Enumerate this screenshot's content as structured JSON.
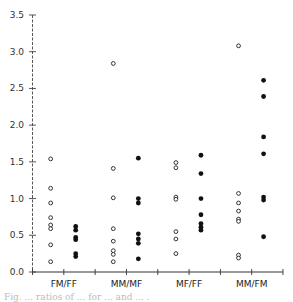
{
  "chart_data": {
    "type": "scatter",
    "title": "",
    "xlabel": "",
    "ylabel": "",
    "ylim": [
      0,
      3.5
    ],
    "yticks": [
      0.0,
      0.5,
      1.0,
      1.5,
      2.0,
      2.5,
      3.0,
      3.5
    ],
    "ytick_labels": [
      "0.0",
      "0.5",
      "1.0",
      "1.5",
      "2.0",
      "2.5",
      "3.0",
      "3.5"
    ],
    "categories": [
      "FM/FF",
      "MM/MF",
      "MF/FF",
      "MM/FM"
    ],
    "grid": false,
    "legend": null,
    "series": [
      {
        "name": "open",
        "marker": "open-circle",
        "values": [
          [
            1.54,
            1.14,
            0.94,
            0.74,
            0.64,
            0.59,
            0.37,
            0.14
          ],
          [
            2.84,
            1.41,
            1.01,
            0.59,
            0.42,
            0.29,
            0.24,
            0.14
          ],
          [
            1.49,
            1.42,
            1.02,
            0.99,
            0.55,
            0.45,
            0.25
          ],
          [
            3.08,
            1.07,
            0.94,
            0.83,
            0.72,
            0.69,
            0.23,
            0.19
          ]
        ]
      },
      {
        "name": "filled",
        "marker": "filled-circle",
        "values": [
          [
            0.62,
            0.57,
            0.47,
            0.44,
            0.25,
            0.21
          ],
          [
            1.55,
            1.0,
            0.94,
            0.52,
            0.45,
            0.39,
            0.18
          ],
          [
            1.59,
            1.34,
            1.0,
            0.78,
            0.66,
            0.61,
            0.57
          ],
          [
            2.61,
            2.39,
            1.84,
            1.61,
            1.02,
            0.98,
            0.48
          ]
        ]
      }
    ]
  },
  "caption_partial": "Fig. ... ratios of ... for ... and ... ."
}
